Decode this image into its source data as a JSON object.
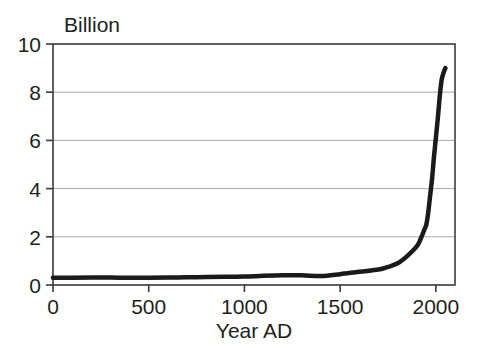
{
  "chart_data": {
    "type": "line",
    "title": "",
    "subtitle": "",
    "unit_label": "Billion",
    "xlabel": "Year AD",
    "ylabel": "",
    "xlim": [
      0,
      2100
    ],
    "ylim": [
      0,
      10
    ],
    "grid": "horizontal",
    "legend": "none",
    "xticks": [
      0,
      500,
      1000,
      1500,
      2000
    ],
    "xtick_labels": [
      "0",
      "500",
      "1000",
      "1500",
      "2000"
    ],
    "yticks": [
      0,
      2,
      4,
      6,
      8,
      10
    ],
    "ytick_labels": [
      "0",
      "2",
      "4",
      "6",
      "8",
      "10"
    ],
    "series": [
      {
        "name": "World population",
        "color": "#1a1a1a",
        "line_width": 4.5,
        "x": [
          0,
          100,
          200,
          300,
          400,
          500,
          600,
          700,
          800,
          900,
          1000,
          1100,
          1200,
          1300,
          1400,
          1500,
          1600,
          1700,
          1750,
          1800,
          1850,
          1900,
          1920,
          1940,
          1950,
          1960,
          1970,
          1980,
          1990,
          2000,
          2010,
          2020,
          2030,
          2040,
          2050
        ],
        "values": [
          0.3,
          0.3,
          0.31,
          0.31,
          0.3,
          0.3,
          0.31,
          0.32,
          0.33,
          0.34,
          0.35,
          0.38,
          0.4,
          0.4,
          0.37,
          0.45,
          0.55,
          0.64,
          0.75,
          0.9,
          1.2,
          1.6,
          1.9,
          2.3,
          2.5,
          3.0,
          3.7,
          4.4,
          5.3,
          6.1,
          6.9,
          7.8,
          8.5,
          8.8,
          9.0
        ]
      }
    ]
  },
  "axes": {
    "plot_left": 53,
    "plot_right": 455,
    "plot_top": 44,
    "plot_bottom": 285
  }
}
